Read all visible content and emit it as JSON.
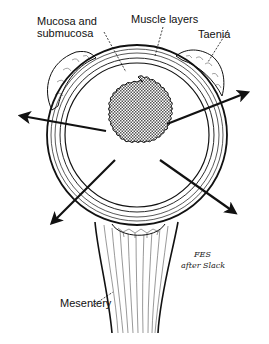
{
  "diagram": {
    "labels": {
      "mucosa_line1": "Mucosa and",
      "mucosa_line2": "submucosa",
      "muscle": "Muscle layers",
      "taenia": "Taenia",
      "mesentery": "Mesentery"
    },
    "signature": {
      "line1": "FES",
      "line2": "after Slack"
    },
    "arrows": [
      {
        "direction": "left",
        "from": [
          106,
          131
        ],
        "to": [
          16,
          115
        ]
      },
      {
        "direction": "upper-right",
        "from": [
          167,
          124
        ],
        "to": [
          253,
          90
        ]
      },
      {
        "direction": "lower-left",
        "from": [
          115,
          160
        ],
        "to": [
          48,
          227
        ]
      },
      {
        "direction": "lower-right",
        "from": [
          160,
          160
        ],
        "to": [
          240,
          216
        ]
      }
    ],
    "colors": {
      "ink": "#111111",
      "background": "#ffffff",
      "stipple": "#8a8a8a"
    }
  }
}
